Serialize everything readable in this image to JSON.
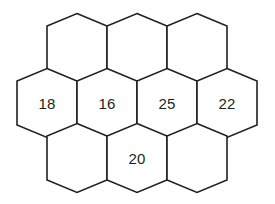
{
  "figure": {
    "background_color": "#ffffff",
    "stroke_color": "#231f20",
    "fill_color": "#ffffff",
    "label_color": "#231f20",
    "stroke_width": 1.6,
    "orientation": "pointy-top",
    "rows": [
      3,
      4,
      3
    ],
    "total_cells": 10
  },
  "chart_data": {
    "type": "diagram",
    "layout": "honeycomb-3-4-3",
    "categories": [
      "top-left",
      "top-center",
      "top-right",
      "middle-1",
      "middle-2",
      "middle-3",
      "middle-4",
      "bottom-left",
      "bottom-center",
      "bottom-right"
    ],
    "values": [
      null,
      null,
      null,
      18,
      16,
      25,
      22,
      null,
      20,
      null
    ],
    "labels": [
      "",
      "",
      "",
      "18",
      "16",
      "25",
      "22",
      "",
      "20",
      ""
    ]
  },
  "cells": [
    {
      "id": "top-left",
      "row": 0,
      "col": 0,
      "cx": 77,
      "cy": 48,
      "label": ""
    },
    {
      "id": "top-center",
      "row": 0,
      "col": 1,
      "cx": 137,
      "cy": 48,
      "label": ""
    },
    {
      "id": "top-right",
      "row": 0,
      "col": 2,
      "cx": 197,
      "cy": 48,
      "label": ""
    },
    {
      "id": "middle-1",
      "row": 1,
      "col": 0,
      "cx": 47,
      "cy": 103,
      "label": "18"
    },
    {
      "id": "middle-2",
      "row": 1,
      "col": 1,
      "cx": 107,
      "cy": 103,
      "label": "16"
    },
    {
      "id": "middle-3",
      "row": 1,
      "col": 2,
      "cx": 167,
      "cy": 103,
      "label": "25"
    },
    {
      "id": "middle-4",
      "row": 1,
      "col": 3,
      "cx": 227,
      "cy": 103,
      "label": "22"
    },
    {
      "id": "bottom-left",
      "row": 2,
      "col": 0,
      "cx": 77,
      "cy": 158,
      "label": ""
    },
    {
      "id": "bottom-center",
      "row": 2,
      "col": 1,
      "cx": 137,
      "cy": 158,
      "label": "20"
    },
    {
      "id": "bottom-right",
      "row": 2,
      "col": 2,
      "cx": 197,
      "cy": 158,
      "label": ""
    }
  ]
}
